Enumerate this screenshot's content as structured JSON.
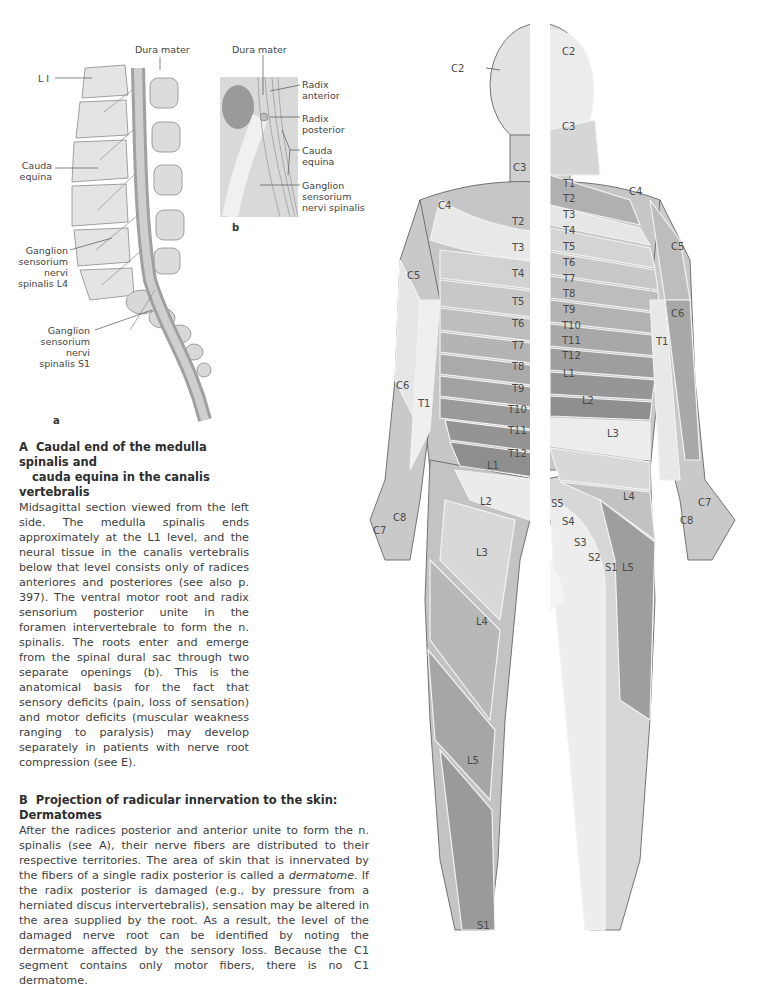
{
  "figure_a": {
    "letter": "a",
    "labels": {
      "dura_mater": "Dura mater",
      "l1": "L I",
      "cauda_equina": [
        "Cauda",
        "equina"
      ],
      "ganglion_l4": [
        "Ganglion",
        "sensorium",
        "nervi",
        "spinalis L4"
      ],
      "ganglion_s1": [
        "Ganglion",
        "sensorium",
        "nervi",
        "spinalis S1"
      ]
    }
  },
  "figure_b": {
    "letter": "b",
    "labels": {
      "dura_mater": "Dura mater",
      "radix_anterior": [
        "Radix",
        "anterior"
      ],
      "radix_posterior": [
        "Radix",
        "posterior"
      ],
      "cauda_equina": [
        "Cauda",
        "equina"
      ],
      "ganglion": [
        "Ganglion",
        "sensorium",
        "nervi spinalis"
      ]
    }
  },
  "caption_a": {
    "letter": "A",
    "title_line1": "Caudal end of the medulla spinalis and",
    "title_line2": "cauda equina in the canalis vertebralis",
    "body": "Midsagittal section viewed from the left side. The medulla spinalis ends approximately at the L1 level, and the neural tissue in the canalis vertebralis below that level consists only of radices anteriores and posteriores (see also p. 397). The ventral motor root and radix sensorium posterior unite in the foramen intervertebrale to form the n. spinalis. The roots enter and emerge from the spinal dural sac through two separate openings (b). This is the anatomical basis for the fact that sensory deficits (pain, loss of sensation) and motor deficits (muscular weakness ranging to paralysis) may develop separately in patients with nerve root compression (see E)."
  },
  "caption_b": {
    "letter": "B",
    "title": "Projection of radicular innervation to the skin: Dermatomes",
    "body_part1": "After the radices posterior and anterior unite to form the n. spinalis (see A), their nerve fibers are distributed to their respective territories. The area of skin that is innervated by the fibers of a single radix posterior is called a ",
    "body_em": "dermatome",
    "body_part2": ". If the radix posterior is damaged (e.g., by pressure from a herniated discus intervertebralis), sensation may be altered in the area supplied by the root. As a result, the level of the damaged nerve root can be identified by noting the dermatome affected by the sensory loss. Because the C1 segment contains only motor fibers, there is no C1 dermatome."
  },
  "dermatome_figure": {
    "front_labels": [
      "C2",
      "C3",
      "C4",
      "T2",
      "T3",
      "T4",
      "T5",
      "T6",
      "T7",
      "T8",
      "T9",
      "T10",
      "T11",
      "T12",
      "L1",
      "L2",
      "L3",
      "L4",
      "L5",
      "S1",
      "C5",
      "C6",
      "T1",
      "C7",
      "C8"
    ],
    "back_labels": [
      "C2",
      "C3",
      "T1",
      "T2",
      "T3",
      "T4",
      "T5",
      "T6",
      "T7",
      "T8",
      "T9",
      "T10",
      "T11",
      "T12",
      "L1",
      "L2",
      "L3",
      "L4",
      "L5",
      "S1",
      "S2",
      "S3",
      "S4",
      "S5",
      "C4",
      "C5",
      "C6",
      "T1",
      "C7",
      "C8"
    ],
    "colors": {
      "skin_light": "#e6e6e6",
      "skin_mid": "#c8c8c8",
      "skin_dark": "#9c9c9c",
      "outline": "#555555"
    }
  }
}
